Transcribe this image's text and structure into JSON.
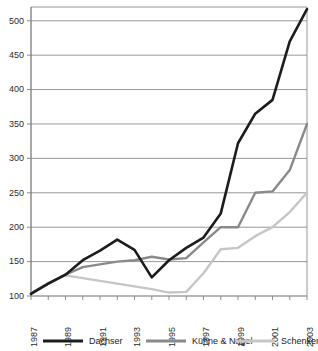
{
  "chart_data": {
    "type": "line",
    "title": "",
    "subtitle": "",
    "xlabel": "",
    "ylabel": "",
    "grid": true,
    "legend_position": "bottom",
    "xlim": [
      1987,
      2003
    ],
    "ylim": [
      100,
      520
    ],
    "yticks": [
      100,
      150,
      200,
      250,
      300,
      350,
      400,
      450,
      500
    ],
    "ytick_labels": [
      "100",
      "150",
      "200",
      "250",
      "300",
      "350",
      "400",
      "450",
      "500"
    ],
    "x": [
      1987,
      1988,
      1989,
      1990,
      1991,
      1992,
      1993,
      1994,
      1995,
      1996,
      1997,
      1998,
      1999,
      2000,
      2001,
      2002,
      2003
    ],
    "xticks": [
      1987,
      1988,
      1989,
      1990,
      1991,
      1992,
      1993,
      1994,
      1995,
      1996,
      1997,
      1998,
      1999,
      2000,
      2001,
      2002,
      2003
    ],
    "xtick_labels": [
      "1987",
      "",
      "1989",
      "",
      "1991",
      "",
      "1993",
      "",
      "1995",
      "",
      "1997",
      "",
      "1999",
      "",
      "2001",
      "",
      "2003"
    ],
    "xtick_labels_shown": [
      "1987",
      "1989",
      "1991",
      "1993",
      "1995",
      "1997",
      "1999",
      "2001",
      "2003"
    ],
    "series": [
      {
        "name": "Dachser",
        "color": "#1c1c1c",
        "width": 2.6,
        "values": [
          103,
          118,
          131,
          152,
          166,
          182,
          167,
          127,
          152,
          170,
          185,
          220,
          322,
          365,
          385,
          470,
          517
        ]
      },
      {
        "name": "Kühne & Nagel",
        "color": "#8a8a8a",
        "width": 2.4,
        "values": [
          104,
          118,
          131,
          142,
          146,
          150,
          152,
          157,
          153,
          155,
          178,
          200,
          200,
          250,
          252,
          283,
          350
        ]
      },
      {
        "name": "Schenker",
        "color": "#c6c6c6",
        "width": 2.4,
        "values": [
          104,
          119,
          130,
          126,
          122,
          118,
          114,
          110,
          105,
          106,
          133,
          168,
          170,
          187,
          200,
          222,
          250
        ]
      }
    ]
  },
  "legend": {
    "items": [
      {
        "label": "Dachser",
        "color": "#1c1c1c"
      },
      {
        "label": "Kühne & Nagel",
        "color": "#8a8a8a"
      },
      {
        "label": "Schenker",
        "color": "#c6c6c6"
      }
    ]
  },
  "axes": {
    "frame_color": "#8c8c8c",
    "grid_color": "#8c8c8c",
    "tick_color": "#8c8c8c"
  }
}
